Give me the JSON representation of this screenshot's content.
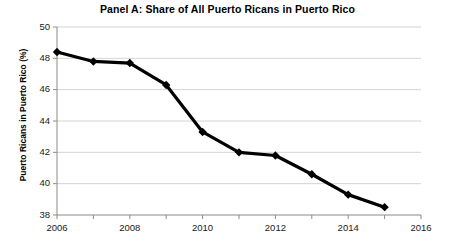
{
  "chart_data": {
    "type": "line",
    "title": "Panel A: Share of All Puerto Ricans in Puerto Rico",
    "xlabel": "",
    "ylabel": "Puerto Ricans in Puerto Rico (%)",
    "x": [
      2006,
      2007,
      2008,
      2009,
      2010,
      2011,
      2012,
      2013,
      2014,
      2015
    ],
    "values": [
      48.4,
      47.8,
      47.7,
      46.3,
      43.3,
      42.0,
      41.8,
      40.6,
      39.3,
      38.5
    ],
    "series": [
      {
        "name": "Puerto Ricans in Puerto Rico (%)",
        "values": [
          48.4,
          47.8,
          47.7,
          46.3,
          43.3,
          42.0,
          41.8,
          40.6,
          39.3,
          38.5
        ]
      }
    ],
    "xlim": [
      2006,
      2016
    ],
    "ylim": [
      38,
      50
    ],
    "y_ticks": [
      38,
      40,
      42,
      44,
      46,
      48,
      50
    ],
    "x_ticks": [
      2006,
      2008,
      2010,
      2012,
      2014,
      2016
    ],
    "x_minor_ticks": [
      2007,
      2009,
      2011,
      2013,
      2015
    ],
    "grid": "horizontal",
    "legend": "none",
    "line_color": "#000000",
    "marker": "diamond",
    "grid_color": "#c9c9c9",
    "background": "#ffffff"
  },
  "axis": {
    "y_tick_labels": [
      "50",
      "48",
      "46",
      "44",
      "42",
      "40",
      "38"
    ],
    "x_tick_labels": [
      "2006",
      "2008",
      "2010",
      "2012",
      "2014",
      "2016"
    ]
  }
}
